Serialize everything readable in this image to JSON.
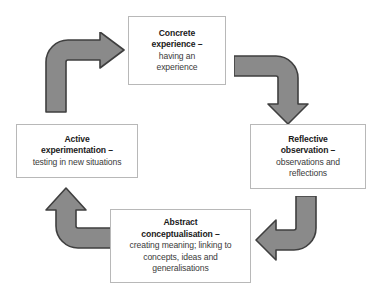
{
  "diagram": {
    "name": "Kolb experiential learning cycle",
    "background_color": "#ffffff",
    "box_border_color": "#b8b8b8",
    "arrow_fill_color": "#8a8a8a",
    "arrow_stroke_color": "#3f3f3f",
    "text_color": "#1a1a1a",
    "nodes": [
      {
        "id": "concrete-experience",
        "title": "Concrete\nexperience –",
        "description": "having an\nexperience"
      },
      {
        "id": "reflective-observation",
        "title": "Reflective\nobservation –",
        "description": "observations and\nreflections"
      },
      {
        "id": "abstract-conceptualisation",
        "title": "Abstract\nconceptualisation –",
        "description": "creating meaning; linking to\nconcepts, ideas and\ngeneralisations"
      },
      {
        "id": "active-experimentation",
        "title": "Active\nexperimentation –",
        "description": "testing in new situations"
      }
    ],
    "arrows": [
      {
        "id": "arrow-active-to-concrete",
        "from": "active-experimentation",
        "to": "concrete-experience",
        "direction": "up-then-right"
      },
      {
        "id": "arrow-concrete-to-reflective",
        "from": "concrete-experience",
        "to": "reflective-observation",
        "direction": "right-then-down"
      },
      {
        "id": "arrow-reflective-to-abstract",
        "from": "reflective-observation",
        "to": "abstract-conceptualisation",
        "direction": "down-then-left"
      },
      {
        "id": "arrow-abstract-to-active",
        "from": "abstract-conceptualisation",
        "to": "active-experimentation",
        "direction": "left-then-up"
      }
    ]
  }
}
